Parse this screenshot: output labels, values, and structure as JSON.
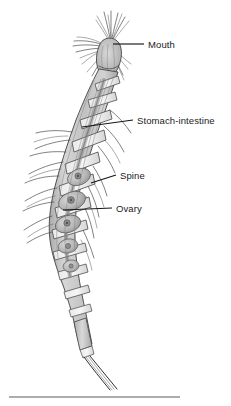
{
  "figure": {
    "title": "",
    "background_color": "#ffffff",
    "body_fill_color": "#c8c8c8",
    "body_outline_color": "#4a4a4a",
    "label_color": "#1b1b1b",
    "leader_color": "#14161a",
    "rule_color": "#5a5a5a"
  },
  "labels": [
    {
      "id": "mouth",
      "text": "Mouth",
      "text_x": 148,
      "text_y": 48,
      "leader": "M 113 44 L 144 44",
      "points_to": "head / mouth appendages"
    },
    {
      "id": "stomach-intestine",
      "text": "Stomach-intestine",
      "text_x": 137,
      "text_y": 124,
      "leader": "M 82 127 L 133 120",
      "points_to": "dorsal gut running along thorax"
    },
    {
      "id": "spine",
      "text": "Spine",
      "text_x": 120,
      "text_y": 179,
      "leader": "M 91 183 L 116 175",
      "points_to": "lateral spine on thoracic segment"
    },
    {
      "id": "ovary",
      "text": "Ovary",
      "text_x": 116,
      "text_y": 212,
      "leader": "M 63 210 L 112 208",
      "points_to": "oval ovary within segment"
    }
  ],
  "divider": {
    "id": "bottom-rule",
    "x1": 9,
    "y1": 397,
    "x2": 180,
    "y2": 397
  }
}
